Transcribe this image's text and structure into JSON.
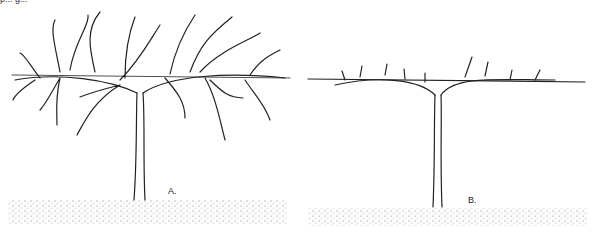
{
  "figure": {
    "caption_fragment": "p... g...",
    "panels": [
      {
        "label": "A.",
        "description": "unpruned vine with long canes along trellis wire"
      },
      {
        "label": "B.",
        "description": "pruned vine with short spurs along cordon on trellis wire"
      }
    ]
  },
  "colors": {
    "ink": "#222222",
    "ground": "#555555",
    "background": "#ffffff"
  }
}
